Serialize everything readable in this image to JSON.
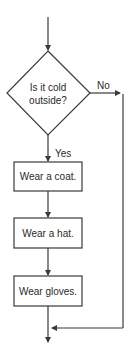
{
  "diagram": {
    "type": "flowchart",
    "decision": {
      "line1": "Is it cold",
      "line2": "outside?"
    },
    "branch_no_label": "No",
    "branch_yes_label": "Yes",
    "steps": [
      {
        "label": "Wear a coat."
      },
      {
        "label": "Wear a hat."
      },
      {
        "label": "Wear gloves."
      }
    ],
    "colors": {
      "stroke": "#3a3a3a",
      "text": "#2a2a2a",
      "background": "#ffffff"
    }
  }
}
